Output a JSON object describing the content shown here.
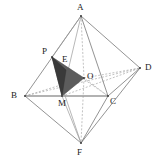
{
  "figure": {
    "name": "octahedron-with-shaded-section",
    "width": 161,
    "height": 168,
    "background": "#ffffff",
    "stroke_solid": "#777777",
    "stroke_hidden": "#a8a8a8",
    "stroke_highlight": "#999999",
    "fill_mid": "#5c5c5c",
    "fill_dark": "#3a3a3a",
    "label_color": "#1a1a1a"
  },
  "points": {
    "A": {
      "label": "A",
      "x": 81,
      "y": 16,
      "label_x": 77,
      "label_y": 3
    },
    "B": {
      "label": "B",
      "x": 25,
      "y": 96,
      "label_x": 11,
      "label_y": 91
    },
    "C": {
      "label": "C",
      "x": 108,
      "y": 96,
      "label_x": 110,
      "label_y": 97
    },
    "D": {
      "label": "D",
      "x": 140,
      "y": 68,
      "label_x": 145,
      "label_y": 63
    },
    "F": {
      "label": "F",
      "x": 81,
      "y": 143,
      "label_x": 77,
      "label_y": 148
    },
    "O": {
      "label": "O",
      "x": 84,
      "y": 78,
      "label_x": 87,
      "label_y": 72
    },
    "P": {
      "label": "P",
      "x": 52,
      "y": 57,
      "label_x": 42,
      "label_y": 47
    },
    "E": {
      "label": "E",
      "x": 64,
      "y": 68,
      "label_x": 62,
      "label_y": 55
    },
    "M": {
      "label": "M",
      "x": 62,
      "y": 96,
      "label_x": 58,
      "label_y": 99
    }
  },
  "edges": {
    "solid": [
      {
        "name": "edge-A-B",
        "from": "A",
        "to": "B"
      },
      {
        "name": "edge-A-C",
        "from": "A",
        "to": "C"
      },
      {
        "name": "edge-A-D",
        "from": "A",
        "to": "D"
      },
      {
        "name": "edge-B-F",
        "from": "B",
        "to": "F"
      },
      {
        "name": "edge-C-F",
        "from": "C",
        "to": "F"
      },
      {
        "name": "edge-D-F",
        "from": "D",
        "to": "F"
      },
      {
        "name": "edge-C-D",
        "from": "C",
        "to": "D"
      },
      {
        "name": "edge-B-C",
        "from": "B",
        "to": "C"
      }
    ],
    "hidden": [
      {
        "name": "edge-A-O",
        "from": "A",
        "to": "O"
      },
      {
        "name": "edge-O-F",
        "from": "O",
        "to": "F"
      },
      {
        "name": "edge-B-O",
        "from": "B",
        "to": "O"
      },
      {
        "name": "edge-O-D",
        "from": "O",
        "to": "D"
      },
      {
        "name": "edge-B-D",
        "from": "B",
        "to": "D"
      },
      {
        "name": "edge-C-O",
        "from": "C",
        "to": "O"
      },
      {
        "name": "edge-A-P",
        "from": "A",
        "to": "P"
      },
      {
        "name": "edge-P-F",
        "from": "P",
        "to": "F"
      },
      {
        "name": "edge-P-C",
        "from": "P",
        "to": "C"
      },
      {
        "name": "edge-M-D",
        "from": "M",
        "to": "D"
      },
      {
        "name": "edge-A-M",
        "from": "A",
        "to": "M"
      },
      {
        "name": "edge-M-F",
        "from": "M",
        "to": "F"
      }
    ]
  },
  "shaded_regions": [
    {
      "name": "section-P-O-M",
      "fill": "#5c5c5c",
      "polygon": "52,57 84,78 62,96"
    },
    {
      "name": "section-P-E-M",
      "fill": "#3a3a3a",
      "polygon": "52,57 66,70 62,96"
    }
  ],
  "highlight_edges": [
    {
      "name": "highlight-B-C",
      "from": "B",
      "to": "C"
    }
  ]
}
